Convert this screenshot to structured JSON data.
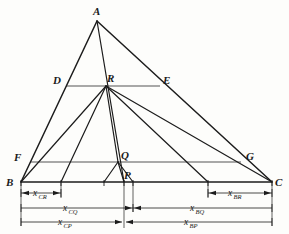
{
  "figure": {
    "kind": "geometry-diagram",
    "background_color": "#fdfdfb",
    "ink_color": "#1c1c1c",
    "parallel_line_color": "#555555"
  },
  "points": {
    "A": {
      "label": "A",
      "x": 97,
      "y": 21,
      "label_x": 95,
      "label_y": 14
    },
    "B": {
      "label": "B",
      "x": 21,
      "y": 182,
      "label_x": 9,
      "label_y": 185
    },
    "C": {
      "label": "C",
      "x": 272,
      "y": 182,
      "label_x": 276,
      "label_y": 185
    },
    "D": {
      "label": "D",
      "x": 66,
      "y": 86,
      "label_x": 56,
      "label_y": 83
    },
    "E": {
      "label": "E",
      "x": 160,
      "y": 86,
      "label_x": 163,
      "label_y": 83
    },
    "F": {
      "label": "F",
      "x": 30,
      "y": 162,
      "label_x": 16,
      "label_y": 160
    },
    "G": {
      "label": "G",
      "x": 241,
      "y": 162,
      "label_x": 247,
      "label_y": 159
    },
    "R": {
      "label": "R",
      "x": 106,
      "y": 86,
      "label_x": 108,
      "label_y": 81
    },
    "Q": {
      "label": "Q",
      "x": 118,
      "y": 162,
      "label_x": 122,
      "label_y": 158
    },
    "P": {
      "label": "P",
      "x": 124,
      "y": 182,
      "label_x": 125,
      "label_y": 178
    }
  },
  "segments": {
    "triangle_sides": [
      {
        "name": "AB",
        "from": "A",
        "to": "B"
      },
      {
        "name": "AC",
        "from": "A",
        "to": "C"
      },
      {
        "name": "BC",
        "from": "B",
        "to": "C"
      }
    ],
    "parallels": [
      {
        "name": "DE",
        "from": "D",
        "to": "E"
      },
      {
        "name": "FG",
        "from": "F",
        "to": "G"
      }
    ],
    "cevians": [
      {
        "name": "AP",
        "from": "A",
        "to": "P"
      },
      {
        "name": "BR",
        "from": "B",
        "to": "R"
      },
      {
        "name": "CR",
        "from": "C",
        "to": "R"
      },
      {
        "name": "RQ",
        "from": "R",
        "to": "Q"
      },
      {
        "name": "BQ",
        "from": "B",
        "to": "Q"
      },
      {
        "name": "CQ",
        "from": "C",
        "to": "Q"
      },
      {
        "name": "QP-left",
        "from": "Q",
        "to": "baseline-left-foot"
      },
      {
        "name": "QP-right",
        "from": "Q",
        "to": "baseline-right-foot"
      }
    ],
    "baseline_feet": {
      "cr_foot_x": 61,
      "cq_foot_x": 104,
      "p_x": 124,
      "bq_foot_x": 133,
      "br_foot_x": 208
    }
  },
  "dimensions": [
    {
      "id": "x_CR",
      "base": "x",
      "sub": "CR",
      "row": 1,
      "y": 193,
      "from_x": 21,
      "to_x": 61,
      "label_x": 33,
      "arrows": "inner",
      "text": "x"
    },
    {
      "id": "x_BR",
      "base": "x",
      "sub": "BR",
      "row": 1,
      "y": 193,
      "from_x": 208,
      "to_x": 272,
      "label_x": 228,
      "arrows": "inner",
      "text": "x"
    },
    {
      "id": "x_CQ",
      "base": "x",
      "sub": "CQ",
      "row": 2,
      "y": 208,
      "from_x": 21,
      "to_x": 133,
      "label_x": 63,
      "arrows": "right",
      "text": "x"
    },
    {
      "id": "x_BQ",
      "base": "x",
      "sub": "BQ",
      "row": 2,
      "y": 208,
      "from_x": 133,
      "to_x": 272,
      "label_x": 190,
      "arrows": "left",
      "text": "x"
    },
    {
      "id": "x_CP",
      "base": "x",
      "sub": "CP",
      "row": 3,
      "y": 222,
      "from_x": 21,
      "to_x": 124,
      "label_x": 58,
      "arrows": "right",
      "text": "x"
    },
    {
      "id": "x_BP",
      "base": "x",
      "sub": "BP",
      "row": 3,
      "y": 222,
      "from_x": 124,
      "to_x": 272,
      "label_x": 184,
      "arrows": "left",
      "text": "x"
    }
  ],
  "labels": {
    "x_CR_base": "x",
    "x_CR_sub": "CR",
    "x_BR_base": "x",
    "x_BR_sub": "BR",
    "x_CQ_base": "x",
    "x_CQ_sub": "CQ",
    "x_BQ_base": "x",
    "x_BQ_sub": "BQ",
    "x_CP_base": "x",
    "x_CP_sub": "CP",
    "x_BP_base": "x",
    "x_BP_sub": "BP"
  }
}
